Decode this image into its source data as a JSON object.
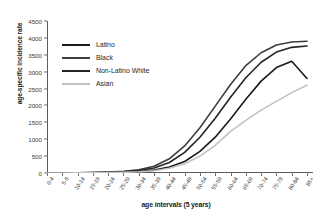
{
  "chart_data": {
    "type": "line",
    "title": "",
    "xlabel": "age intervals (5 years)",
    "ylabel": "age-specific incidence rate",
    "categories": [
      "0-4",
      "5-9",
      "10-14",
      "15-19",
      "20-24",
      "25-29",
      "30-34",
      "35-39",
      "40-44",
      "45-49",
      "50-54",
      "55-59",
      "60-64",
      "65-69",
      "70-74",
      "75-79",
      "80-84",
      "85+"
    ],
    "ylim": [
      0,
      4500
    ],
    "yticks": [
      0,
      500,
      1000,
      1500,
      2000,
      2500,
      3000,
      3500,
      4000,
      4500
    ],
    "grid": false,
    "legend_position": "upper-left",
    "series": [
      {
        "name": "Latino",
        "color": "#1a1a1a",
        "values": [
          2,
          3,
          5,
          8,
          14,
          25,
          45,
          85,
          175,
          340,
          640,
          1060,
          1600,
          2180,
          2720,
          3120,
          3310,
          2800
        ]
      },
      {
        "name": "Black",
        "color": "#3d3d3d",
        "values": [
          3,
          5,
          8,
          14,
          26,
          48,
          95,
          200,
          420,
          800,
          1340,
          1980,
          2620,
          3180,
          3560,
          3790,
          3880,
          3900
        ]
      },
      {
        "name": "Non-Latino White",
        "color": "#242424",
        "values": [
          2,
          4,
          6,
          11,
          20,
          38,
          72,
          150,
          310,
          610,
          1060,
          1620,
          2240,
          2820,
          3280,
          3580,
          3720,
          3760
        ]
      },
      {
        "name": "Asian",
        "color": "#c2c2c2",
        "values": [
          1,
          2,
          4,
          6,
          11,
          20,
          36,
          68,
          140,
          275,
          500,
          820,
          1230,
          1560,
          1860,
          2120,
          2380,
          2600
        ]
      }
    ]
  }
}
